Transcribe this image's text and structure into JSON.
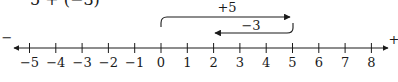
{
  "expression": "5 + (−3)",
  "number_line": {
    "min": -5,
    "max": 8,
    "ticks": [
      "−5",
      "−4",
      "−3",
      "−2",
      "−1",
      "0",
      "1",
      "2",
      "3",
      "4",
      "5",
      "6",
      "7",
      "8"
    ],
    "negative_end_label": "−",
    "positive_end_label": "+"
  },
  "moves": [
    {
      "label": "+5",
      "from": 0,
      "to": 5,
      "direction": "right"
    },
    {
      "label": "−3",
      "from": 5,
      "to": 2,
      "direction": "left"
    }
  ],
  "colors": {
    "ink": "#1a1a1a",
    "background": "#ffffff"
  }
}
